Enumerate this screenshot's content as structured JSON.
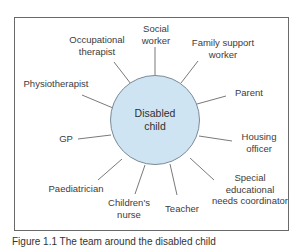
{
  "diagram": {
    "center": {
      "line1": "Disabled",
      "line2": "child",
      "fill": "#cfe4f3"
    },
    "nodes": [
      {
        "id": "social-worker",
        "line1": "Social",
        "line2": "worker"
      },
      {
        "id": "family-support-worker",
        "line1": "Family support",
        "line2": "worker"
      },
      {
        "id": "parent",
        "line1": "Parent"
      },
      {
        "id": "housing-officer",
        "line1": "Housing",
        "line2": "officer"
      },
      {
        "id": "senco",
        "line1": "Special",
        "line2": "educational",
        "line3": "needs coordinator"
      },
      {
        "id": "teacher",
        "line1": "Teacher"
      },
      {
        "id": "childrens-nurse",
        "line1": "Children's",
        "line2": "nurse"
      },
      {
        "id": "paediatrician",
        "line1": "Paediatrician"
      },
      {
        "id": "gp",
        "line1": "GP"
      },
      {
        "id": "physiotherapist",
        "line1": "Physiotherapist"
      },
      {
        "id": "occupational-therapist",
        "line1": "Occupational",
        "line2": "therapist"
      }
    ]
  },
  "caption": "Figure 1.1  The team around the disabled child"
}
